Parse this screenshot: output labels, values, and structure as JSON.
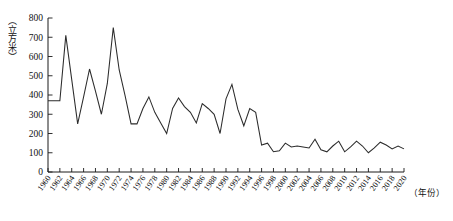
{
  "chart_data": {
    "type": "line",
    "title": "",
    "subtitle": "",
    "xlabel": "（年份）",
    "ylabel": "（立方米）",
    "ylim": [
      0,
      800
    ],
    "ytick_step": 100,
    "yticks": [
      0,
      100,
      200,
      300,
      400,
      500,
      600,
      700,
      800
    ],
    "ytick_labels": [
      "0",
      "100",
      "200",
      "300",
      "400",
      "500",
      "600",
      "700",
      "800"
    ],
    "xlim": [
      1960,
      2020
    ],
    "xtick_step": 2,
    "xtick_labels": [
      "1960",
      "1962",
      "1964",
      "1966",
      "1968",
      "1970",
      "1972",
      "1974",
      "1976",
      "1978",
      "1980",
      "1982",
      "1984",
      "1986",
      "1988",
      "1990",
      "1992",
      "1994",
      "1996",
      "1998",
      "2000",
      "2002",
      "2004",
      "2006",
      "2008",
      "2010",
      "2012",
      "2014",
      "2016",
      "2018",
      "2020"
    ],
    "grid": false,
    "legend": "none",
    "legend_entries": [],
    "annotations": [],
    "line_color": "#2b2b2b",
    "x": [
      1960,
      1961,
      1962,
      1963,
      1964,
      1965,
      1966,
      1967,
      1968,
      1969,
      1970,
      1971,
      1972,
      1973,
      1974,
      1975,
      1976,
      1977,
      1978,
      1979,
      1980,
      1981,
      1982,
      1983,
      1984,
      1985,
      1986,
      1987,
      1988,
      1989,
      1990,
      1991,
      1992,
      1993,
      1994,
      1995,
      1996,
      1997,
      1998,
      1999,
      2000,
      2001,
      2002,
      2003,
      2004,
      2005,
      2006,
      2007,
      2008,
      2009,
      2010,
      2011,
      2012,
      2013,
      2014,
      2015,
      2016,
      2017,
      2018,
      2019,
      2020
    ],
    "values": [
      370,
      370,
      370,
      710,
      480,
      250,
      390,
      535,
      420,
      300,
      460,
      750,
      530,
      395,
      250,
      250,
      330,
      390,
      310,
      255,
      200,
      330,
      385,
      340,
      310,
      255,
      355,
      330,
      300,
      200,
      380,
      455,
      325,
      240,
      330,
      310,
      140,
      150,
      105,
      110,
      150,
      130,
      135,
      130,
      125,
      170,
      115,
      105,
      135,
      160,
      105,
      130,
      160,
      135,
      100,
      125,
      155,
      140,
      120,
      135,
      120
    ]
  },
  "figure": {
    "axis_color": "#1a1a1a",
    "background": "#ffffff"
  }
}
